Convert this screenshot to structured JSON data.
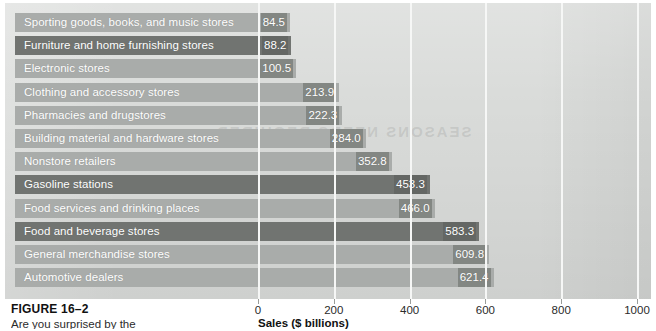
{
  "figure": {
    "caption_title": "FIGURE 16–2",
    "caption_text": "Are you surprised by the"
  },
  "chart_data": {
    "type": "bar",
    "orientation": "horizontal",
    "title": "",
    "subtitle": "",
    "xlabel": "Sales ($ billions)",
    "ylabel": "",
    "xlim": [
      0,
      1100
    ],
    "xticks": [
      0,
      200,
      400,
      600,
      800,
      1000
    ],
    "xtick_labels": [
      "0",
      "200",
      "400",
      "600",
      "800",
      "1000"
    ],
    "grid": true,
    "grid_axis": "x",
    "legend": false,
    "legend_position": "none",
    "value_labels": true,
    "categories": [
      "Sporting goods, books, and music stores",
      "Furniture and home furnishing stores",
      "Electronic stores",
      "Clothing and accessory stores",
      "Pharmacies and drugstores",
      "Building material and hardware stores",
      "Nonstore retailers",
      "Gasoline stations",
      "Food services and drinking places",
      "Food and beverage stores",
      "General merchandise stores",
      "Automotive dealers"
    ],
    "values": [
      84.5,
      88.2,
      100.5,
      213.9,
      222.3,
      284.0,
      352.8,
      453.3,
      466.0,
      583.3,
      609.8,
      621.4
    ],
    "value_labels_text": [
      "84.5",
      "88.2",
      "100.5",
      "213.9",
      "222.3",
      "284.0",
      "352.8",
      "453.3",
      "466.0",
      "583.3",
      "609.8",
      "621.4"
    ],
    "bar_shades": [
      "light",
      "dark",
      "light",
      "light",
      "light",
      "light",
      "light",
      "dark",
      "light",
      "dark",
      "light",
      "light"
    ]
  },
  "colors": {
    "panel_background": "#d9dbd9",
    "bar_light": "#a9acaa",
    "bar_dark": "#717471",
    "gridline": "#f6f7f6",
    "label_text": "#ffffff",
    "axis_text": "#2b2b2b",
    "page_background": "#ffffff"
  },
  "bleed_text": {
    "line_one": "SEASONS NEEDS REQUIRED"
  }
}
